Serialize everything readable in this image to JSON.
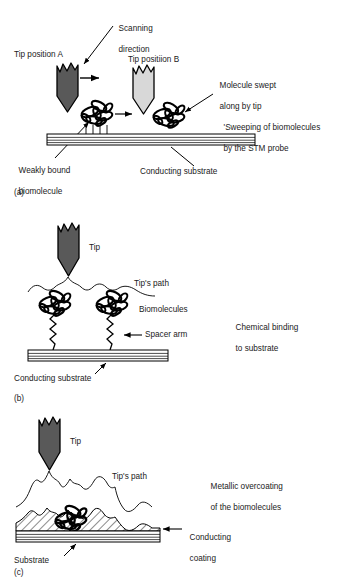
{
  "figure": {
    "type": "scientific-schematic"
  },
  "panels": [
    {
      "id": "a",
      "panel_label": "(a)",
      "side_note_line1": "'Sweeping of biomolecules",
      "side_note_line2": "by the STM probe",
      "labels": {
        "scanning_direction_line1": "Scanning",
        "scanning_direction_line2": "direction",
        "tip_position_a": "Tip position A",
        "tip_position_b": "Tip positiion B",
        "molecule_swept_line1": "Molecule swept",
        "molecule_swept_line2": "along by tip",
        "weakly_bound_line1": "Weakly bound",
        "weakly_bound_line2": "biomolecule",
        "conducting_substrate": "Conducting substrate"
      }
    },
    {
      "id": "b",
      "panel_label": "(b)",
      "side_note_line1": "Chemical binding",
      "side_note_line2": "to substrate",
      "labels": {
        "tip": "Tip",
        "tips_path": "Tip's path",
        "biomolecules": "Biomolecules",
        "spacer_arm": "Spacer arm",
        "conducting_substrate": "Conducting substrate"
      }
    },
    {
      "id": "c",
      "panel_label": "(c)",
      "side_note_line1": "Metallic overcoating",
      "side_note_line2": "of the biomolecules",
      "labels": {
        "tip": "Tip",
        "tips_path": "Tip's path",
        "conducting_coating_line1": "Conducting",
        "conducting_coating_line2": "coating",
        "substrate": "Substrate"
      }
    }
  ],
  "colors": {
    "tip_dark": "#595959",
    "tip_light": "#d8d8d8",
    "outline": "#000000",
    "background": "#ffffff",
    "substrate_fill": "#ffffff",
    "text": "#1a1a1a"
  }
}
